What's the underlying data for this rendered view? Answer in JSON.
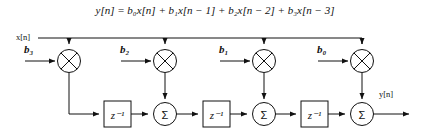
{
  "figure": {
    "title": "",
    "equation": {
      "lhs": "y[n]",
      "equals": "=",
      "terms": [
        "b₀x[n]",
        "+ b₁x[n − 1]",
        "+ b₂x[n − 2]",
        "+ b₃x[n − 3]"
      ],
      "full_text": "y[n] = b₀x[n] + b₁x[n − 1] + b₂x[n − 2] + b₃x[n − 3]"
    },
    "input_label": "x[n]",
    "output_label": "y[n]",
    "coefficients": [
      {
        "name": "b3",
        "label": "b₃"
      },
      {
        "name": "b2",
        "label": "b₂"
      },
      {
        "name": "b1",
        "label": "b₁"
      },
      {
        "name": "b0",
        "label": "b₀"
      }
    ],
    "delay_blocks": [
      {
        "name": "delay-1",
        "label": "z⁻¹"
      },
      {
        "name": "delay-2",
        "label": "z⁻¹"
      },
      {
        "name": "delay-3",
        "label": "z⁻¹"
      }
    ],
    "adders": [
      {
        "name": "adder-1",
        "label": "Σ"
      },
      {
        "name": "adder-2",
        "label": "Σ"
      },
      {
        "name": "adder-3",
        "label": "Σ"
      }
    ],
    "multipliers": [
      {
        "name": "multiplier-b3",
        "label": "⊗"
      },
      {
        "name": "multiplier-b2",
        "label": "⊗"
      },
      {
        "name": "multiplier-b1",
        "label": "⊗"
      },
      {
        "name": "multiplier-b0",
        "label": "⊗"
      }
    ],
    "colors": {
      "line": "#111111",
      "background": "#ffffff",
      "fill": "#ffffff"
    }
  }
}
